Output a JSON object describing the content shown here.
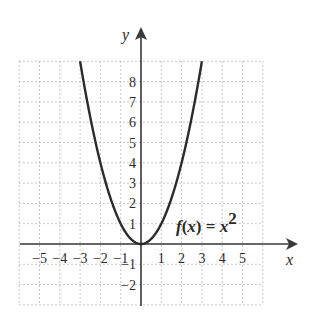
{
  "chart_data": {
    "type": "line",
    "title": "",
    "function_label": "f(x) = x²",
    "function_label_parts": {
      "lhs": "f",
      "paren_open": "(",
      "var": "x",
      "paren_close": ")",
      "eq": " = ",
      "rhs_var": "x",
      "exp": "2"
    },
    "xlabel": "x",
    "ylabel": "y",
    "xlim": [
      -6,
      7.5
    ],
    "ylim": [
      -3,
      10.5
    ],
    "grid": true,
    "grid_style": "dotted",
    "x_tick_labels": [
      "-5",
      "-4",
      "-3",
      "-2",
      "-1",
      "1",
      "2",
      "3",
      "4",
      "5"
    ],
    "x_ticks": [
      -5,
      -4,
      -3,
      -2,
      -1,
      1,
      2,
      3,
      4,
      5
    ],
    "y_tick_labels": [
      "8",
      "7",
      "6",
      "5",
      "4",
      "3",
      "2",
      "1",
      "-1",
      "-2"
    ],
    "y_ticks": [
      8,
      7,
      6,
      5,
      4,
      3,
      2,
      1,
      -1,
      -2
    ],
    "series": [
      {
        "name": "f(x) = x^2",
        "x": [
          -3,
          -2.5,
          -2,
          -1.5,
          -1,
          -0.5,
          0,
          0.5,
          1,
          1.5,
          2,
          2.5,
          3
        ],
        "y": [
          9,
          6.25,
          4,
          2.25,
          1,
          0.25,
          0,
          0.25,
          1,
          2.25,
          4,
          6.25,
          9
        ]
      }
    ],
    "colors": {
      "curve": "#2b2b2b",
      "axes": "#3a3a3a",
      "grid": "#b5b5b5"
    }
  }
}
